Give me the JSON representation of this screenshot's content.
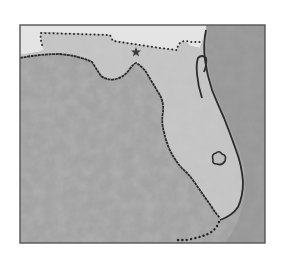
{
  "map": {
    "title": "Florida",
    "subject": "State of Florida with surrounding Gulf of Mexico and Atlantic Ocean",
    "style": "grayscale textured",
    "features": [
      {
        "name": "Florida peninsula",
        "type": "land"
      },
      {
        "name": "Gulf of Mexico",
        "type": "water"
      },
      {
        "name": "Atlantic Ocean",
        "type": "water"
      },
      {
        "name": "Georgia/Alabama border",
        "type": "state-border-dotted"
      },
      {
        "name": "St. Johns River",
        "type": "river"
      },
      {
        "name": "Lake Okeechobee",
        "type": "lake"
      },
      {
        "name": "Florida Keys",
        "type": "island-chain-dotted"
      },
      {
        "name": "Capital (Tallahassee)",
        "type": "capital-star"
      }
    ],
    "colors": {
      "background": "#ffffff",
      "frame": "#555555",
      "land": "#c4c4c4",
      "neighbor_land": "#e6e6e6",
      "water": "#9a9a9a",
      "water_light": "#b8b8b8",
      "coastline": "#2a2a2a",
      "border_dots": "#333333"
    }
  }
}
